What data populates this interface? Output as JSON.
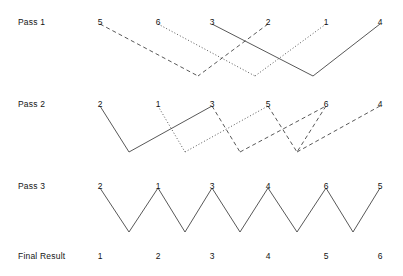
{
  "diagram": {
    "label_x": 18,
    "columns_x": [
      100,
      158,
      212,
      268,
      326,
      380
    ],
    "stroke_color": "#3a3a3a",
    "rows": [
      {
        "name": "pass-1",
        "label": "Pass 1",
        "label_y": 17,
        "numbers_y": 17,
        "top_y": 24,
        "bottom_y": 76,
        "numbers": [
          "5",
          "6",
          "3",
          "2",
          "1",
          "4"
        ],
        "segments": [
          {
            "name": "seg-5-down",
            "style": "dashed",
            "from_col": 0,
            "from_level": "top",
            "to_x": 198,
            "to_level": "bottom"
          },
          {
            "name": "seg-2-down",
            "style": "dashed",
            "from_col": 3,
            "from_level": "top",
            "to_x": 198,
            "to_level": "bottom"
          },
          {
            "name": "seg-6-down",
            "style": "dotted",
            "from_col": 1,
            "from_level": "top",
            "to_x": 255,
            "to_level": "bottom"
          },
          {
            "name": "seg-1-down",
            "style": "dotted",
            "from_col": 4,
            "from_level": "top",
            "to_x": 255,
            "to_level": "bottom"
          },
          {
            "name": "seg-3-down",
            "style": "solid",
            "from_col": 2,
            "from_level": "top",
            "to_x": 313,
            "to_level": "bottom"
          },
          {
            "name": "seg-4-down",
            "style": "solid",
            "from_col": 5,
            "from_level": "top",
            "to_x": 313,
            "to_level": "bottom"
          }
        ]
      },
      {
        "name": "pass-2",
        "label": "Pass 2",
        "label_y": 99,
        "numbers_y": 99,
        "top_y": 106,
        "bottom_y": 152,
        "numbers": [
          "2",
          "1",
          "3",
          "5",
          "6",
          "4"
        ],
        "segments": [
          {
            "name": "seg-2-to-v1",
            "style": "solid",
            "from_col": 0,
            "from_level": "top",
            "to_x": 129,
            "to_level": "bottom"
          },
          {
            "name": "seg-v1-to-3",
            "style": "solid",
            "from_x": 129,
            "from_level": "bottom",
            "to_col": 2,
            "to_level": "top"
          },
          {
            "name": "seg-1-to-v2",
            "style": "dotted",
            "from_col": 1,
            "from_level": "top",
            "to_x": 185,
            "to_level": "bottom"
          },
          {
            "name": "seg-v2-to-5",
            "style": "dotted",
            "from_x": 185,
            "from_level": "bottom",
            "to_col": 3,
            "to_level": "top"
          },
          {
            "name": "seg-3-to-v3",
            "style": "dashed",
            "from_col": 2,
            "from_level": "top",
            "to_x": 240,
            "to_level": "bottom"
          },
          {
            "name": "seg-v3-to-6",
            "style": "dashed",
            "from_x": 240,
            "from_level": "bottom",
            "to_col": 4,
            "to_level": "top"
          },
          {
            "name": "seg-5-to-v4",
            "style": "dashed",
            "from_col": 3,
            "from_level": "top",
            "to_x": 297,
            "to_level": "bottom"
          },
          {
            "name": "seg-v4-to-4",
            "style": "dashed",
            "from_x": 297,
            "from_level": "bottom",
            "to_col": 5,
            "to_level": "top"
          },
          {
            "name": "seg-6-to-v4b",
            "style": "dashed",
            "from_col": 4,
            "from_level": "top",
            "to_x": 297,
            "to_level": "bottom"
          }
        ]
      },
      {
        "name": "pass-3",
        "label": "Pass 3",
        "label_y": 181,
        "numbers_y": 181,
        "top_y": 188,
        "bottom_y": 232,
        "numbers": [
          "2",
          "1",
          "3",
          "4",
          "6",
          "5"
        ],
        "segments": [
          {
            "name": "seg-a-down",
            "style": "solid",
            "from_col": 0,
            "from_level": "top",
            "to_x": 129,
            "to_level": "bottom"
          },
          {
            "name": "seg-a-up",
            "style": "solid",
            "from_x": 129,
            "from_level": "bottom",
            "to_col": 1,
            "to_level": "top"
          },
          {
            "name": "seg-b-down",
            "style": "solid",
            "from_col": 1,
            "from_level": "top",
            "to_x": 185,
            "to_level": "bottom"
          },
          {
            "name": "seg-b-up",
            "style": "solid",
            "from_x": 185,
            "from_level": "bottom",
            "to_col": 2,
            "to_level": "top"
          },
          {
            "name": "seg-c-down",
            "style": "solid",
            "from_col": 2,
            "from_level": "top",
            "to_x": 240,
            "to_level": "bottom"
          },
          {
            "name": "seg-c-up",
            "style": "solid",
            "from_x": 240,
            "from_level": "bottom",
            "to_col": 3,
            "to_level": "top"
          },
          {
            "name": "seg-d-down",
            "style": "solid",
            "from_col": 3,
            "from_level": "top",
            "to_x": 297,
            "to_level": "bottom"
          },
          {
            "name": "seg-d-up",
            "style": "solid",
            "from_x": 297,
            "from_level": "bottom",
            "to_col": 4,
            "to_level": "top"
          },
          {
            "name": "seg-e-down",
            "style": "solid",
            "from_col": 4,
            "from_level": "top",
            "to_x": 353,
            "to_level": "bottom"
          },
          {
            "name": "seg-e-up",
            "style": "solid",
            "from_x": 353,
            "from_level": "bottom",
            "to_col": 5,
            "to_level": "top"
          }
        ]
      },
      {
        "name": "final-result",
        "label": "Final Result",
        "label_y": 251,
        "numbers_y": 251,
        "numbers": [
          "1",
          "2",
          "3",
          "4",
          "5",
          "6"
        ],
        "segments": []
      }
    ]
  }
}
